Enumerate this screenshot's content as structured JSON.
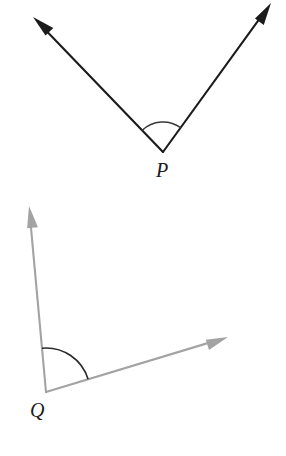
{
  "figure": {
    "background_color": "#ffffff",
    "width": 286,
    "height": 456,
    "angles": [
      {
        "id": "angle-P",
        "vertex_label": "P",
        "vertex": {
          "x": 163,
          "y": 152
        },
        "label_position": {
          "x": 156,
          "y": 177
        },
        "stroke_color": "#1b1b1b",
        "stroke_width": 2.1,
        "arc_color": "#3a3a3a",
        "arc_radius": 30,
        "measure_degrees": 73,
        "opening_direction": "upward",
        "rays": [
          {
            "id": "ray-P-left",
            "tip": {
              "x": 33,
              "y": 17
            },
            "direction_degrees": 134,
            "arrowhead": "solid-triangle"
          },
          {
            "id": "ray-P-right",
            "tip": {
              "x": 271,
              "y": 3
            },
            "direction_degrees": 54,
            "arrowhead": "solid-triangle"
          }
        ]
      },
      {
        "id": "angle-Q",
        "vertex_label": "Q",
        "vertex": {
          "x": 46,
          "y": 392
        },
        "label_position": {
          "x": 30,
          "y": 417
        },
        "stroke_color": "#a3a3a3",
        "stroke_width": 2.1,
        "arc_color": "#2b2b2b",
        "arc_radius": 44,
        "measure_degrees": 78,
        "opening_direction": "upper-right",
        "rays": [
          {
            "id": "ray-Q-up",
            "tip": {
              "x": 29,
              "y": 206
            },
            "direction_degrees": 95,
            "arrowhead": "solid-triangle"
          },
          {
            "id": "ray-Q-right",
            "tip": {
              "x": 228,
              "y": 337
            },
            "direction_degrees": 17,
            "arrowhead": "solid-triangle"
          }
        ]
      }
    ]
  }
}
